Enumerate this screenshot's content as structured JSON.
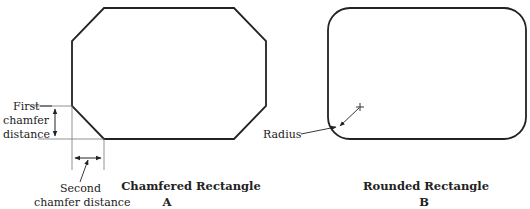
{
  "figure_a": {
    "caption": "Chamfered Rectangle",
    "letter": "A",
    "first_chamfer_label": [
      "First",
      "chamfer",
      "distance"
    ],
    "second_chamfer_label": [
      "Second",
      "chamfer distance"
    ]
  },
  "figure_b": {
    "caption": "Rounded Rectangle",
    "letter": "B",
    "radius_label": "Radius"
  }
}
